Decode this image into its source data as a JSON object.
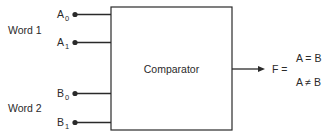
{
  "diagram": {
    "type": "block-diagram",
    "block": {
      "label": "Comparator"
    },
    "groups": [
      {
        "label": "Word 1",
        "inputs": [
          {
            "name": "A",
            "subscript": "0"
          },
          {
            "name": "A",
            "subscript": "1"
          }
        ]
      },
      {
        "label": "Word 2",
        "inputs": [
          {
            "name": "B",
            "subscript": "0"
          },
          {
            "name": "B",
            "subscript": "1"
          }
        ]
      }
    ],
    "output": {
      "label": "F =",
      "cases": [
        "A = B",
        "A ≠ B"
      ]
    },
    "colors": {
      "line": "#2a2a2a",
      "background": "#ffffff"
    }
  }
}
